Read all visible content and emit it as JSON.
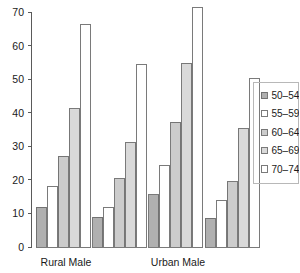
{
  "chart_data": {
    "type": "bar",
    "title": "",
    "subtitle": "",
    "xlabel": "",
    "ylabel": "",
    "grid": false,
    "legend_position": "right",
    "categories": [
      "Rural Male",
      "",
      "Urban Male",
      ""
    ],
    "category_labels_visible": [
      "Rural Male",
      "Urban Male"
    ],
    "ylim": [
      0,
      70
    ],
    "yticks": [
      0,
      10,
      20,
      30,
      40,
      50,
      60,
      70
    ],
    "ytick_labels": [
      "0",
      "10",
      "20",
      "30",
      "40",
      "50",
      "60",
      "70"
    ],
    "series": [
      {
        "name": "50–54",
        "color": "#b0b0b0",
        "values": [
          11.8,
          8.8,
          15.6,
          8.5
        ]
      },
      {
        "name": "55–59",
        "color": "#ffffff",
        "values": [
          18.1,
          11.8,
          24.3,
          13.8
        ]
      },
      {
        "name": "60–64",
        "color": "#cccccc",
        "values": [
          27.0,
          20.4,
          37.1,
          19.5
        ]
      },
      {
        "name": "65–69",
        "color": "#d9d9d9",
        "values": [
          41.2,
          31.0,
          54.8,
          35.2
        ]
      },
      {
        "name": "70–74",
        "color": "#ffffff",
        "values": [
          66.2,
          54.4,
          71.3,
          50.2
        ]
      }
    ]
  },
  "legend": {
    "entries": [
      {
        "label": "50–54"
      },
      {
        "label": "55–59"
      },
      {
        "label": "60–64"
      },
      {
        "label": "65–69"
      },
      {
        "label": "70–74"
      }
    ]
  },
  "axis": {
    "y_tick_labels": [
      "70",
      "60",
      "50",
      "40",
      "30",
      "20",
      "10",
      "0"
    ],
    "x_tick_labels": [
      "Rural Male",
      "Urban Male"
    ]
  },
  "colors": {
    "axis": "#5a5a5a",
    "bar_stroke": "#6b6b6b",
    "text": "#1a1a1a",
    "legend_border": "#b8b8b8",
    "background": "#ffffff"
  }
}
